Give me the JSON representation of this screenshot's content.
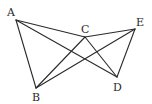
{
  "figure": {
    "type": "geometry-diagram",
    "points": {
      "A": {
        "label": "A",
        "x": 16,
        "y": 20,
        "lx": 7,
        "ly": 16
      },
      "B": {
        "label": "B",
        "x": 36,
        "y": 88,
        "lx": 32,
        "ly": 101
      },
      "C": {
        "label": "C",
        "x": 85,
        "y": 37,
        "lx": 81,
        "ly": 33
      },
      "D": {
        "label": "D",
        "x": 117,
        "y": 77,
        "lx": 113,
        "ly": 91
      },
      "E": {
        "label": "E",
        "x": 135,
        "y": 29,
        "lx": 136,
        "ly": 26
      }
    },
    "segments": [
      [
        "A",
        "C"
      ],
      [
        "C",
        "E"
      ],
      [
        "A",
        "B"
      ],
      [
        "A",
        "D"
      ],
      [
        "B",
        "C"
      ],
      [
        "B",
        "E"
      ],
      [
        "C",
        "D"
      ],
      [
        "E",
        "D"
      ]
    ],
    "colors": {
      "line": "#2a2a2a",
      "background": "#ffffff"
    }
  }
}
